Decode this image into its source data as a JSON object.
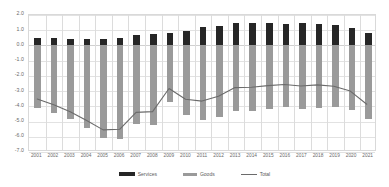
{
  "chart_data": {
    "type": "bar",
    "subtype": "stacked-bar-with-line",
    "title": "",
    "xlabel": "",
    "ylabel": "",
    "ylim": [
      -7.0,
      2.0
    ],
    "ytick_step": 1.0,
    "grid": true,
    "legend_position": "bottom",
    "categories": [
      "2001",
      "2002",
      "2003",
      "2004",
      "2005",
      "2006",
      "2007",
      "2008",
      "2009",
      "2010",
      "2011",
      "2012",
      "2013",
      "2014",
      "2015",
      "2016",
      "2017",
      "2018",
      "2019",
      "2020",
      "2021"
    ],
    "ytick_labels": [
      "2.0",
      "1.0",
      "0.0",
      "-1.0",
      "-2.0",
      "-3.0",
      "-4.0",
      "-5.0",
      "-6.0",
      "-7.0"
    ],
    "ytick_values": [
      2.0,
      1.0,
      0.0,
      -1.0,
      -2.0,
      -3.0,
      -4.0,
      -5.0,
      -6.0,
      -7.0
    ],
    "series": [
      {
        "name": "Services",
        "color": "#262626",
        "type": "bar",
        "values": [
          0.52,
          0.46,
          0.4,
          0.41,
          0.44,
          0.5,
          0.66,
          0.78,
          0.8,
          0.93,
          1.18,
          1.27,
          1.46,
          1.5,
          1.47,
          1.42,
          1.45,
          1.44,
          1.32,
          1.15,
          0.85
        ]
      },
      {
        "name": "Goods",
        "color": "#9a9a9a",
        "type": "bar",
        "values": [
          -4.12,
          -4.45,
          -4.85,
          -5.45,
          -6.1,
          -6.12,
          -5.15,
          -5.22,
          -3.7,
          -4.55,
          -4.92,
          -4.68,
          -4.3,
          -4.32,
          -4.18,
          -4.05,
          -4.18,
          -4.1,
          -4.07,
          -4.22,
          -4.8
        ]
      },
      {
        "name": "Total",
        "color": "#6b6b6b",
        "type": "line",
        "values": [
          -3.6,
          -3.99,
          -4.45,
          -5.04,
          -5.66,
          -5.62,
          -4.49,
          -4.44,
          -2.9,
          -3.62,
          -3.74,
          -3.41,
          -2.84,
          -2.82,
          -2.71,
          -2.63,
          -2.73,
          -2.66,
          -2.75,
          -3.07,
          -3.95
        ]
      }
    ]
  },
  "legend": {
    "items": [
      {
        "label": "Services",
        "swatch": "bar-swatch-dark"
      },
      {
        "label": "Goods",
        "swatch": "bar-swatch-gray"
      },
      {
        "label": "Total",
        "swatch": "line-swatch"
      }
    ]
  },
  "colors": {
    "services": "#262626",
    "goods": "#9a9a9a",
    "total": "#6b6b6b",
    "grid": "#e2e2e2",
    "frame": "#d9d9d9",
    "text": "#6a6a6a",
    "background": "#ffffff"
  }
}
